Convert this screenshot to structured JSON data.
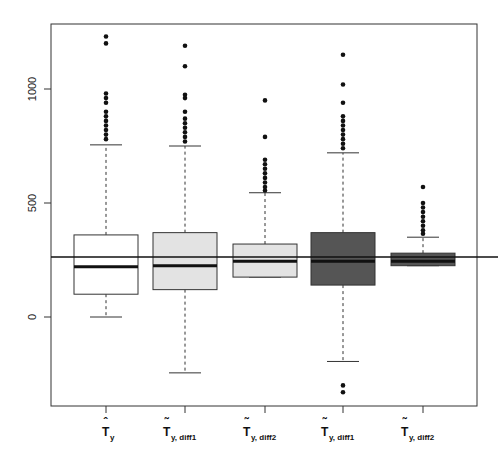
{
  "chart_data": {
    "type": "boxplot",
    "title": "",
    "xlabel": "",
    "ylabel": "",
    "ylim": [
      -400,
      1250
    ],
    "yticks": [
      0,
      500,
      1000
    ],
    "grid": false,
    "legend": null,
    "reference_line": 263,
    "categories": [
      {
        "main": "T",
        "accent": "hat",
        "sub": "y"
      },
      {
        "main": "T",
        "accent": "tilde",
        "sub": "y, diff1"
      },
      {
        "main": "T",
        "accent": "tilde",
        "sub": "y, diff2"
      },
      {
        "main": "T",
        "accent": "tilde",
        "sub": "y, diff1"
      },
      {
        "main": "T",
        "accent": "tilde",
        "sub": "y, diff2"
      }
    ],
    "series": [
      {
        "name": "T_hat_y",
        "fill": "#ffffff",
        "whisker_low": 0,
        "q1": 100,
        "median": 220,
        "q3": 360,
        "whisker_high": 755,
        "outliers": [
          1230,
          1200,
          980,
          960,
          940,
          900,
          880,
          860,
          840,
          820,
          800,
          780
        ]
      },
      {
        "name": "T_tilde_y_diff1_a",
        "fill": "#e3e3e3",
        "whisker_low": -245,
        "q1": 120,
        "median": 225,
        "q3": 370,
        "whisker_high": 750,
        "outliers": [
          1190,
          1100,
          975,
          960,
          900,
          870,
          850,
          830,
          810,
          790,
          770
        ]
      },
      {
        "name": "T_tilde_y_diff2_a",
        "fill": "#e3e3e3",
        "whisker_low": 175,
        "q1": 175,
        "median": 245,
        "q3": 320,
        "whisker_high": 545,
        "outliers": [
          950,
          790,
          690,
          670,
          650,
          630,
          610,
          590,
          570,
          555
        ]
      },
      {
        "name": "T_tilde_y_diff1_b",
        "fill": "#555555",
        "whisker_low": -195,
        "q1": 140,
        "median": 245,
        "q3": 370,
        "whisker_high": 720,
        "outliers": [
          1150,
          1020,
          940,
          880,
          860,
          840,
          820,
          800,
          780,
          760,
          740,
          -300,
          -330
        ]
      },
      {
        "name": "T_tilde_y_diff2_b",
        "fill": "#555555",
        "whisker_low": 225,
        "q1": 225,
        "median": 245,
        "q3": 280,
        "whisker_high": 350,
        "outliers": [
          570,
          500,
          480,
          460,
          440,
          420,
          400,
          380,
          365
        ]
      }
    ]
  }
}
